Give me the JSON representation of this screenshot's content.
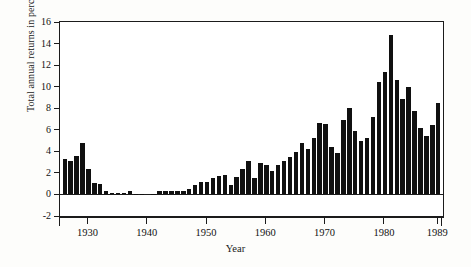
{
  "figure": {
    "title": "",
    "xlabel": "Year",
    "ylabel": "Total annual returns in percent"
  },
  "chart_data": {
    "type": "bar",
    "title": "",
    "xlabel": "Year",
    "ylabel": "Total annual returns in percent",
    "xlim": [
      1925.2,
      1989.8
    ],
    "ylim": [
      -2,
      16
    ],
    "ytick_values": [
      -2,
      0,
      2,
      4,
      6,
      8,
      10,
      12,
      14,
      16
    ],
    "ytick_labels": [
      "-2",
      "0",
      "2",
      "4",
      "6",
      "8",
      "10",
      "12",
      "14",
      "16"
    ],
    "xtick_values": [
      1930,
      1940,
      1950,
      1960,
      1970,
      1980,
      1989
    ],
    "xtick_labels": [
      "1930",
      "1940",
      "1950",
      "1960",
      "1970",
      "1980",
      "1989"
    ],
    "grid": false,
    "legend": null,
    "bar_color": "#101010",
    "categories": [
      1926,
      1927,
      1928,
      1929,
      1930,
      1931,
      1932,
      1933,
      1934,
      1935,
      1936,
      1937,
      1938,
      1939,
      1940,
      1941,
      1942,
      1943,
      1944,
      1945,
      1946,
      1947,
      1948,
      1949,
      1950,
      1951,
      1952,
      1953,
      1954,
      1955,
      1956,
      1957,
      1958,
      1959,
      1960,
      1961,
      1962,
      1963,
      1964,
      1965,
      1966,
      1967,
      1968,
      1969,
      1970,
      1971,
      1972,
      1973,
      1974,
      1975,
      1976,
      1977,
      1978,
      1979,
      1980,
      1981,
      1982,
      1983,
      1984,
      1985,
      1986,
      1987,
      1988,
      1989
    ],
    "values": [
      3.3,
      3.1,
      3.6,
      4.8,
      2.4,
      1.1,
      1.0,
      0.3,
      0.15,
      0.15,
      0.18,
      0.3,
      0.05,
      0.02,
      0.0,
      0.05,
      0.3,
      0.35,
      0.35,
      0.35,
      0.35,
      0.55,
      0.9,
      1.15,
      1.2,
      1.5,
      1.7,
      1.8,
      0.85,
      1.6,
      2.4,
      3.1,
      1.55,
      2.9,
      2.7,
      2.15,
      2.75,
      3.1,
      3.5,
      3.9,
      4.75,
      4.25,
      5.25,
      6.65,
      6.55,
      4.4,
      3.85,
      6.9,
      8.05,
      5.85,
      5.0,
      5.25,
      7.2,
      10.45,
      11.35,
      14.75,
      10.6,
      8.85,
      9.95,
      7.75,
      6.15,
      5.45,
      6.4,
      8.45
    ]
  }
}
